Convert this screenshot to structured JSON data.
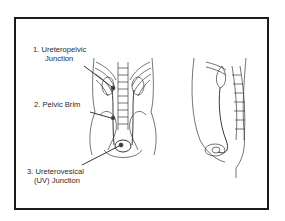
{
  "diagram": {
    "labels": [
      {
        "number": "1.",
        "line1": "1. Ureteropelvic",
        "line2": "Junction"
      },
      {
        "number": "2.",
        "line1": "2. Pelvic Brim"
      },
      {
        "number": "3.",
        "line1": "3. Ureterovesical",
        "line2": "(UV) Junction"
      }
    ],
    "figures": [
      {
        "name": "anterior-view",
        "description": "Front view of torso showing kidneys, ureters, spine, pelvis and bladder"
      },
      {
        "name": "lateral-view",
        "description": "Side view of torso showing kidney, ureter, spine and bladder"
      }
    ],
    "colors": {
      "line": "#2a2a2a",
      "background": "#ffffff",
      "frame": "#1c1c1c"
    }
  }
}
